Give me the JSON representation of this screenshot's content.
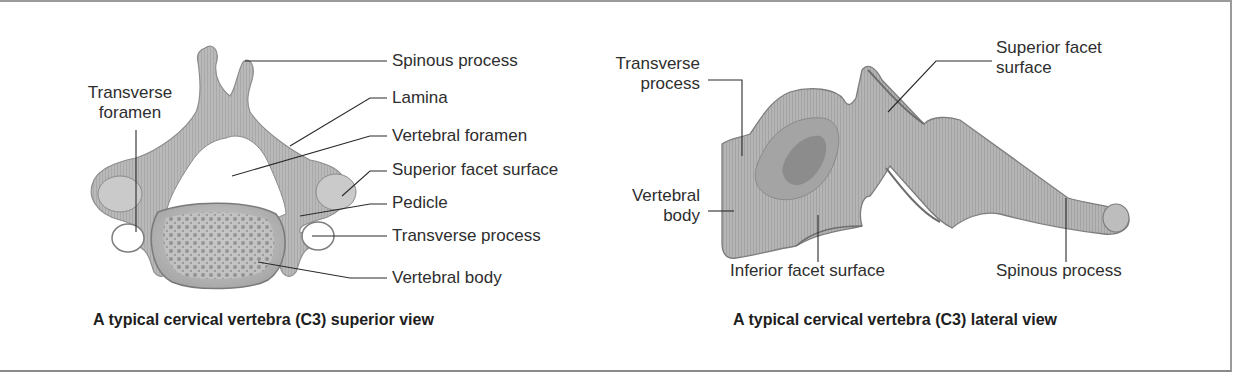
{
  "figure": {
    "panels": [
      {
        "id": "superior",
        "caption": "A typical cervical vertebra (C3) superior view",
        "labels": {
          "transverse_foramen": "Transverse foramen",
          "transverse_foramen_l1": "Transverse",
          "transverse_foramen_l2": "foramen",
          "spinous_process": "Spinous process",
          "lamina": "Lamina",
          "vertebral_foramen": "Vertebral foramen",
          "superior_facet_surface": "Superior facet surface",
          "pedicle": "Pedicle",
          "transverse_process": "Transverse process",
          "vertebral_body": "Vertebral body"
        }
      },
      {
        "id": "lateral",
        "caption": "A typical cervical vertebra (C3) lateral view",
        "labels": {
          "transverse_process_l1": "Transverse",
          "transverse_process_l2": "process",
          "superior_facet_l1": "Superior facet",
          "superior_facet_l2": "surface",
          "vertebral_body_l1": "Vertebral",
          "vertebral_body_l2": "body",
          "inferior_facet_surface": "Inferior facet surface",
          "spinous_process": "Spinous process"
        }
      }
    ],
    "colors": {
      "bone": "#b3b3b3",
      "bone_dark": "#7d7d7d",
      "leader_line": "#2a2a2a",
      "frame": "#9a9a9a"
    }
  }
}
